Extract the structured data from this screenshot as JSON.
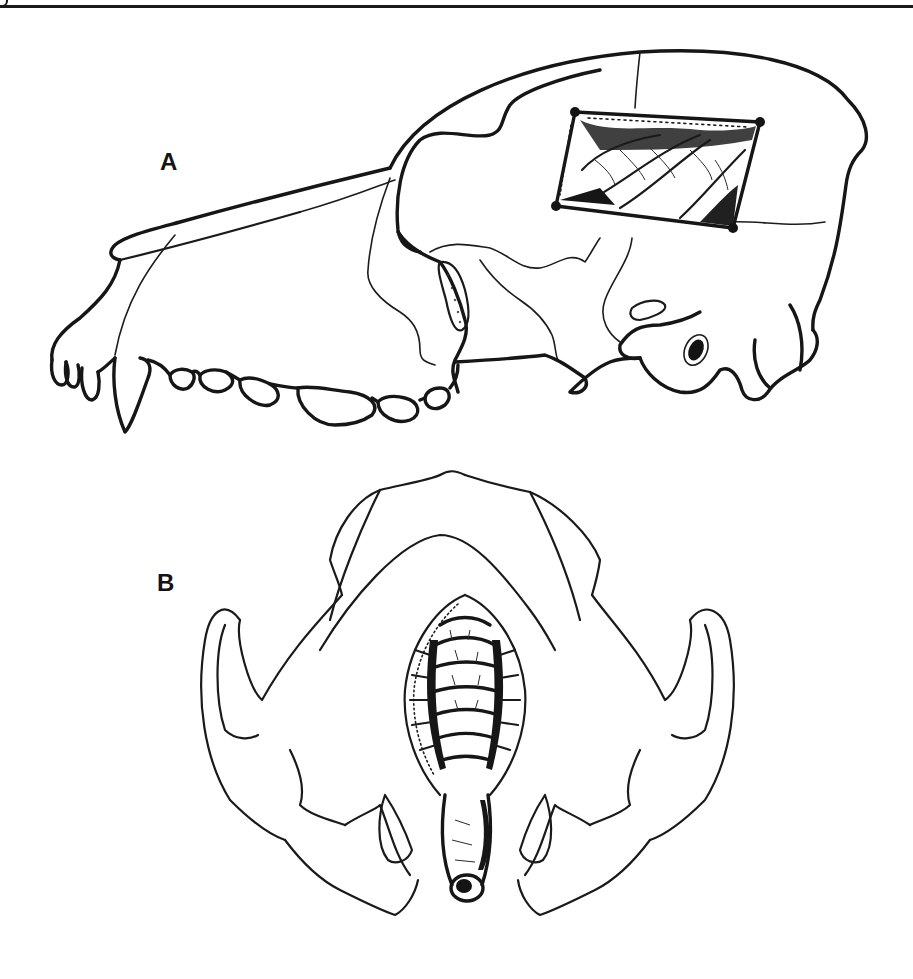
{
  "figure": {
    "panels": [
      {
        "id": "A",
        "label": "A",
        "view": "lateral view of canine skull",
        "features": [
          "craniotomy window exposing cerebral cortex",
          "maxillary dentition",
          "zygomatic arch",
          "tympanic bulla / external acoustic meatus"
        ]
      },
      {
        "id": "B",
        "label": "B",
        "view": "ventral view of canine skull",
        "features": [
          "window in basicranium exposing brainstem",
          "zygomatic arches",
          "tympanic region"
        ]
      }
    ],
    "colors": {
      "ink": "#161616",
      "paper": "#ffffff"
    }
  }
}
